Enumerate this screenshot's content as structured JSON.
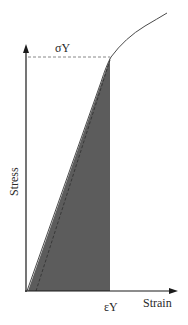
{
  "diagram": {
    "type": "stress-strain",
    "axes": {
      "x_label": "Strain",
      "y_label": "Stress"
    },
    "annotations": {
      "yield_stress": "σY",
      "yield_strain": "εY"
    },
    "colors": {
      "shaded_area": "#5c5c5c",
      "axis": "#1a1a1a",
      "curve": "#4a4a4a",
      "dashed": "#6a6a6a"
    }
  }
}
